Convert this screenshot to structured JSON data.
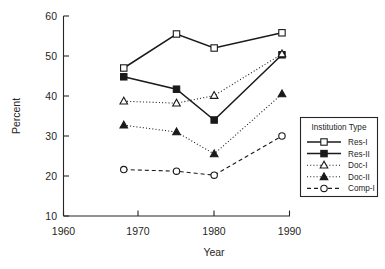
{
  "chart_data": {
    "type": "line",
    "title": "",
    "xlabel": "Year",
    "ylabel": "Percent",
    "xlim": [
      1960,
      1990
    ],
    "ylim": [
      10,
      60
    ],
    "xticks": [
      1960,
      1970,
      1980,
      1990
    ],
    "yticks": [
      10,
      20,
      30,
      40,
      50,
      60
    ],
    "grid": false,
    "legend_position": "right",
    "legend_title": "Institution Type",
    "x": [
      1968,
      1975,
      1980,
      1989
    ],
    "series": [
      {
        "name": "Res-I",
        "values": [
          47.0,
          55.5,
          52.0,
          55.8
        ],
        "marker": "open-square",
        "line_style": "solid"
      },
      {
        "name": "Res-II",
        "values": [
          44.8,
          41.7,
          34.0,
          50.3
        ],
        "marker": "filled-square",
        "line_style": "solid"
      },
      {
        "name": "Doc-I",
        "values": [
          38.7,
          38.2,
          40.1,
          50.5
        ],
        "marker": "open-triangle",
        "line_style": "dotted"
      },
      {
        "name": "Doc-II",
        "values": [
          32.7,
          31.0,
          25.5,
          40.5
        ],
        "marker": "filled-triangle",
        "line_style": "dotted"
      },
      {
        "name": "Comp-I",
        "values": [
          21.6,
          21.2,
          20.2,
          30.0
        ],
        "marker": "open-circle",
        "line_style": "dashed"
      }
    ]
  },
  "axes": {
    "y_title": "Percent",
    "x_title": "Year",
    "x_tick_labels": [
      "1960",
      "1970",
      "1980",
      "1990"
    ],
    "y_tick_labels": [
      "10",
      "20",
      "30",
      "40",
      "50",
      "60"
    ]
  },
  "legend": {
    "title": "Institution Type",
    "items": [
      {
        "label": "Res-I"
      },
      {
        "label": "Res-II"
      },
      {
        "label": "Doc-I"
      },
      {
        "label": "Doc-II"
      },
      {
        "label": "Comp-I"
      }
    ]
  }
}
